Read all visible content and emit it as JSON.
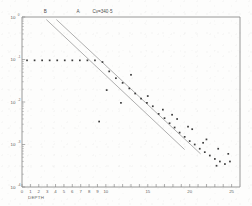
{
  "figure": {
    "name": "semilog-depth-decay-plot",
    "background_color": "#fdfdfc",
    "ink_color": "#3b3b3b",
    "line_color": "#9b9b9b"
  },
  "chart_data": {
    "type": "scatter",
    "title": "",
    "subtitle": "",
    "xlabel": "DEPTH",
    "ylabel": "",
    "grid": false,
    "legend_position": "top",
    "yscale": "log",
    "xlim": [
      0,
      26
    ],
    "ylim_exponents": [
      -4,
      0
    ],
    "y_tick_labels": [
      "1000",
      "100",
      "10",
      "1",
      "0·1"
    ],
    "y_tick_mantissas": [
      "10",
      "10",
      "10",
      "10",
      "10"
    ],
    "y_tick_exponents": [
      "0",
      "-1",
      "-2",
      "-3",
      "-4"
    ],
    "y_tick_display": [
      "10⁰",
      "10⁻¹",
      "10⁻²",
      "10⁻³",
      "10⁻⁴"
    ],
    "x_tick_labels": [
      "0",
      "1",
      "2",
      "3",
      "4",
      "5",
      "6",
      "7",
      "8",
      "9",
      "10",
      "15",
      "20",
      "25"
    ],
    "x_tick_values": [
      0,
      1,
      2,
      3,
      4,
      5,
      6,
      7,
      8,
      9,
      10,
      15,
      20,
      25
    ],
    "annotations": [
      {
        "id": "label-B",
        "text": "B",
        "x": 2.6,
        "y_exp": -0.02
      },
      {
        "id": "label-A",
        "text": "A",
        "x": 6.5,
        "y_exp": -0.02
      },
      {
        "id": "label-cv",
        "text": "Cv=340·5",
        "x": 8.4,
        "y_exp": -0.02
      }
    ],
    "series": [
      {
        "name": "B",
        "type": "line",
        "kind": "fit",
        "points": [
          [
            2.9,
            -0.06
          ],
          [
            19.4,
            -3.12
          ]
        ]
      },
      {
        "name": "A",
        "type": "line",
        "kind": "fit",
        "points": [
          [
            4.1,
            -0.06
          ],
          [
            21.3,
            -3.22
          ]
        ]
      },
      {
        "name": "measured",
        "type": "scatter",
        "x": [
          0.6,
          1.5,
          2.4,
          3.3,
          4.2,
          5.1,
          6.0,
          6.9,
          7.8,
          8.7,
          9.6,
          10.4,
          11.2,
          12.0,
          12.8,
          13.5,
          14.2,
          14.9,
          15.6,
          16.3,
          17.0,
          17.6,
          18.2,
          18.8,
          19.4,
          20.0,
          20.6,
          21.2,
          21.8,
          22.4,
          23.0,
          23.6,
          24.2,
          24.8,
          10.1,
          11.8,
          9.2,
          13.0,
          15.0,
          16.8,
          18.5,
          20.3,
          22.0,
          23.4,
          24.6,
          17.9,
          19.8,
          21.6,
          23.2
        ],
        "y_exp": [
          -1.02,
          -1.02,
          -1.02,
          -1.02,
          -1.02,
          -1.02,
          -1.02,
          -1.02,
          -1.02,
          -1.02,
          -1.06,
          -1.28,
          -1.44,
          -1.55,
          -1.68,
          -1.8,
          -1.92,
          -2.02,
          -2.1,
          -2.28,
          -2.38,
          -2.5,
          -2.6,
          -2.72,
          -2.82,
          -2.92,
          -3.0,
          -3.1,
          -3.18,
          -3.26,
          -3.34,
          -3.4,
          -3.46,
          -3.4,
          -1.72,
          -2.02,
          -2.46,
          -1.36,
          -1.86,
          -2.18,
          -2.4,
          -2.64,
          -2.88,
          -3.1,
          -3.22,
          -2.3,
          -2.58,
          -2.96,
          -3.5
        ]
      }
    ]
  },
  "axes": {
    "x_axis_name": "DEPTH",
    "y_axis_name": ""
  }
}
